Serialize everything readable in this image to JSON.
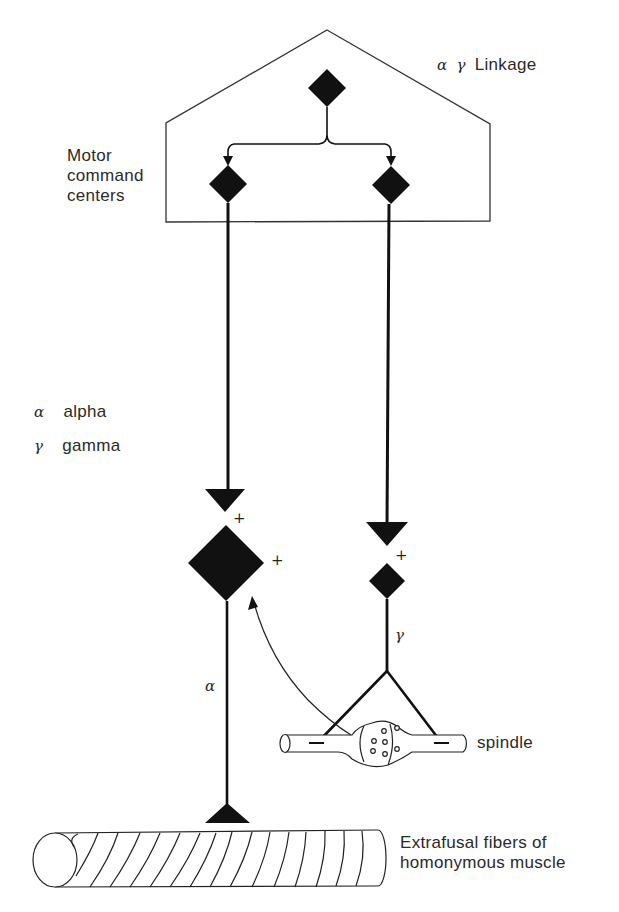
{
  "title_label": {
    "alpha_symbol": "α",
    "gamma_symbol": "γ",
    "text": "Linkage"
  },
  "motor_centers_label": [
    "Motor",
    "command",
    "centers"
  ],
  "legend": [
    {
      "symbol": "α",
      "text": "alpha"
    },
    {
      "symbol": "γ",
      "text": "gamma"
    }
  ],
  "signs": {
    "alpha_input_plus": "+",
    "alpha_feedback_plus": "+",
    "gamma_input_plus": "+"
  },
  "pathway_labels": {
    "alpha": "α",
    "gamma": "γ"
  },
  "spindle_label": "spindle",
  "muscle_label": [
    "Extrafusal fibers of",
    "homonymous muscle"
  ],
  "colors": {
    "ink": "#111111",
    "outline": "#333333",
    "background": "#ffffff"
  }
}
